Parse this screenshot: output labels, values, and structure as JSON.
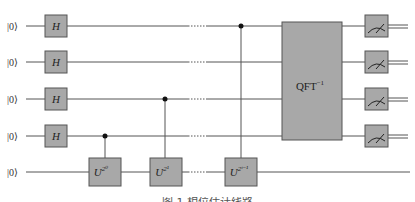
{
  "diagram": {
    "type": "quantum-circuit",
    "name": "Quantum Phase Estimation",
    "colors": {
      "gate_fill": "#a8a8a8",
      "gate_stroke": "#555555",
      "wire": "#555555",
      "background": "#ffffff"
    },
    "qubits": [
      {
        "label": "|0⟩"
      },
      {
        "label": "|0⟩"
      },
      {
        "label": "|0⟩"
      },
      {
        "label": "|0⟩"
      },
      {
        "label": "|0⟩"
      }
    ],
    "hadamard_label": "H",
    "controlled_unitaries": [
      {
        "base": "U",
        "exponent": "2⁰",
        "control_qubit": 4,
        "target_qubit": 5
      },
      {
        "base": "U",
        "exponent": "2¹",
        "control_qubit": 3,
        "target_qubit": 5
      },
      {
        "base": "U",
        "exponent": "2ᵗ⁻¹",
        "control_qubit": 1,
        "target_qubit": 5
      }
    ],
    "qft": {
      "label": "QFT",
      "exponent": "−1"
    },
    "measurements": 4,
    "caption": "图 1  相位估计线路"
  }
}
